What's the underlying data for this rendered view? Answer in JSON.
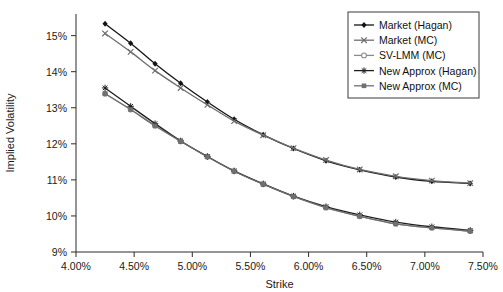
{
  "chart_data": {
    "type": "line",
    "title": "",
    "xlabel": "Strike",
    "ylabel": "Implied Volatility",
    "xlim": [
      4.0,
      7.5
    ],
    "ylim": [
      9,
      15.6
    ],
    "grid": false,
    "legend_position": "top-right",
    "x_tick_labels": [
      "4.00%",
      "4.50%",
      "5.00%",
      "5.50%",
      "6.00%",
      "6.50%",
      "7.00%",
      "7.50%"
    ],
    "x_ticks": [
      4.0,
      4.5,
      5.0,
      5.5,
      6.0,
      6.5,
      7.0,
      7.5
    ],
    "y_tick_labels": [
      "9%",
      "10%",
      "11%",
      "12%",
      "13%",
      "14%",
      "15%"
    ],
    "y_ticks": [
      9,
      10,
      11,
      12,
      13,
      14,
      15
    ],
    "x": [
      4.25,
      4.47,
      4.68,
      4.9,
      5.13,
      5.36,
      5.61,
      5.87,
      6.15,
      6.44,
      6.75,
      7.06,
      7.39
    ],
    "series": [
      {
        "name": "Market (Hagan)",
        "marker": "diamond",
        "color": "#141414",
        "values": [
          15.33,
          14.79,
          14.22,
          13.68,
          13.16,
          12.68,
          12.25,
          11.87,
          11.53,
          11.28,
          11.08,
          10.96,
          10.9
        ]
      },
      {
        "name": "Market (MC)",
        "marker": "x",
        "color": "#6e6e6e",
        "values": [
          15.06,
          14.55,
          14.03,
          13.55,
          13.08,
          12.63,
          12.24,
          11.88,
          11.55,
          11.29,
          11.1,
          10.98,
          10.91
        ]
      },
      {
        "name": "SV-LMM (MC)",
        "marker": "circle-open",
        "color": "#8a8a8a",
        "values": [
          13.39,
          12.95,
          12.5,
          12.07,
          11.64,
          11.24,
          10.88,
          10.54,
          10.23,
          9.99,
          9.78,
          9.67,
          9.58
        ]
      },
      {
        "name": "New Approx (Hagan)",
        "marker": "star",
        "color": "#1f1f1f",
        "values": [
          13.55,
          13.04,
          12.56,
          12.08,
          11.65,
          11.25,
          10.89,
          10.55,
          10.26,
          10.03,
          9.83,
          9.7,
          9.6
        ]
      },
      {
        "name": "New Approx (MC)",
        "marker": "square",
        "color": "#707070",
        "values": [
          13.39,
          12.95,
          12.5,
          12.07,
          11.64,
          11.24,
          10.88,
          10.54,
          10.23,
          9.99,
          9.78,
          9.67,
          9.58
        ]
      }
    ]
  }
}
